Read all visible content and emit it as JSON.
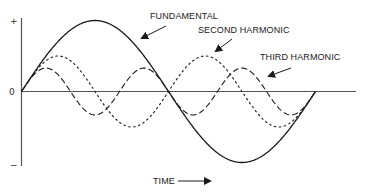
{
  "diagram": {
    "axis": {
      "y_plus_label": "+",
      "y_zero_label": "0",
      "y_minus_label": "−",
      "x_label": "TIME"
    },
    "labels": {
      "fundamental": "FUNDAMENTAL",
      "second": "SECOND HARMONIC",
      "third": "THIRD HARMONIC"
    },
    "waves": [
      {
        "name": "Fundamental",
        "cycles": 1,
        "relative_amplitude": 1.0,
        "style": "solid"
      },
      {
        "name": "Second Harmonic",
        "cycles": 2,
        "relative_amplitude": 0.5,
        "style": "short-dash"
      },
      {
        "name": "Third Harmonic",
        "cycles": 3,
        "relative_amplitude": 0.33,
        "style": "long-dash"
      }
    ],
    "colors": {
      "line": "#1a1a1a",
      "axis": "#555555"
    }
  }
}
